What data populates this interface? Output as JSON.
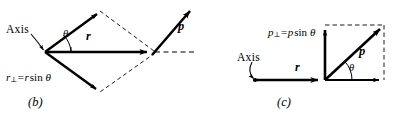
{
  "figure": {
    "background_color": "#ffffff",
    "stroke_color": "#000000"
  },
  "panel_b": {
    "caption": "(b)",
    "axis_label": "Axis",
    "r_label": "r",
    "p_label": "p",
    "theta_label": "θ",
    "perp_equation": {
      "symbol": "r",
      "subscript": "⊥",
      "operator": "=",
      "expression_var": "r",
      "expression_fn": "sin",
      "expression_angle": "θ",
      "full_text": "r⊥ = r sin θ"
    }
  },
  "panel_c": {
    "caption": "(c)",
    "axis_label": "Axis",
    "r_label": "r",
    "p_label": "p",
    "theta_label": "θ",
    "perp_equation": {
      "symbol": "p",
      "subscript": "⊥",
      "operator": "=",
      "expression_var": "p",
      "expression_fn": "sin",
      "expression_angle": "θ",
      "full_text": "p⊥ = p sin θ"
    }
  }
}
